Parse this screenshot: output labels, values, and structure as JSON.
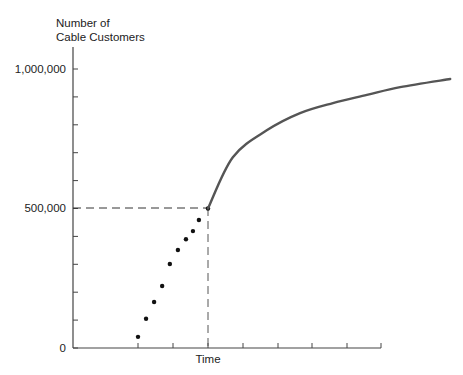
{
  "chart_data": {
    "type": "line",
    "title": "",
    "ylabel_line1": "Number of",
    "ylabel_line2": "Cable Customers",
    "xlabel": "Time",
    "ylim": [
      0,
      1000000
    ],
    "y_tick_labels": [
      "0",
      "500,000",
      "1,000,000"
    ],
    "y_minor_step": 100000,
    "grid": false,
    "reference_point": {
      "x_label": "Time",
      "y": 500000
    },
    "series": [
      {
        "name": "historical (dots)",
        "style": "scatter",
        "x": [
          0.0,
          0.23,
          0.46,
          0.69,
          0.91,
          1.14,
          1.37,
          1.57,
          1.74,
          2.0
        ],
        "values": [
          40000,
          105000,
          165000,
          222000,
          301000,
          351000,
          390000,
          419000,
          459000,
          500000
        ]
      },
      {
        "name": "projected (curve)",
        "style": "line",
        "x": [
          2.0,
          2.71,
          3.69,
          4.63,
          5.57,
          6.54,
          7.49,
          8.92
        ],
        "values": [
          500000,
          684000,
          781000,
          842000,
          878000,
          907000,
          935000,
          964000
        ]
      }
    ],
    "colors": {
      "axis": "#444444",
      "curve": "#555555",
      "dots": "#111111",
      "dashed": "#333333"
    }
  }
}
